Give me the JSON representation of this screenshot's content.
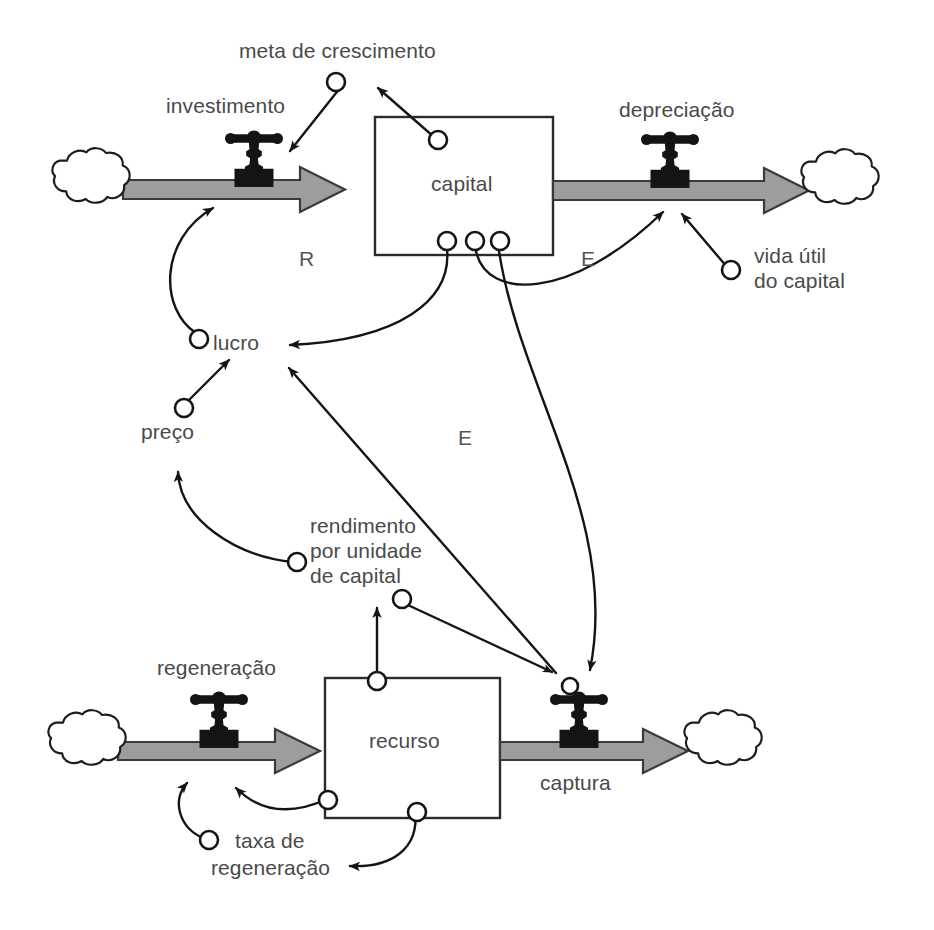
{
  "diagram": {
    "language": "pt-BR",
    "stocks": [
      {
        "id": "capital",
        "label": "capital"
      },
      {
        "id": "recurso",
        "label": "recurso"
      }
    ],
    "flows": [
      {
        "id": "investimento",
        "label": "investimento",
        "direction": "inflow",
        "target": "capital"
      },
      {
        "id": "depreciacao",
        "label": "depreciação",
        "direction": "outflow",
        "source": "capital"
      },
      {
        "id": "regeneracao",
        "label": "regeneração",
        "direction": "inflow",
        "target": "recurso"
      },
      {
        "id": "captura",
        "label": "captura",
        "direction": "outflow",
        "source": "recurso"
      }
    ],
    "variables": [
      {
        "id": "meta_de_crescimento",
        "label": "meta de crescimento"
      },
      {
        "id": "vida_util_do_capital",
        "label": "vida útil\ndo capital",
        "line1": "vida útil",
        "line2": "do capital"
      },
      {
        "id": "lucro",
        "label": "lucro"
      },
      {
        "id": "preco",
        "label": "preço"
      },
      {
        "id": "rendimento_por_unidade_de_capital",
        "label": "rendimento por unidade de capital",
        "line1": "rendimento",
        "line2": "por unidade",
        "line3": "de capital"
      },
      {
        "id": "taxa_de_regeneracao",
        "label": "taxa de regeneração",
        "line1": "taxa de",
        "line2": "regeneração"
      }
    ],
    "loops": [
      {
        "id": "loop-r",
        "label": "R",
        "type": "reinforcing"
      },
      {
        "id": "loop-e-right",
        "label": "E",
        "type": "balancing"
      },
      {
        "id": "loop-e-middle",
        "label": "E",
        "type": "balancing"
      }
    ],
    "colors": {
      "ink": "#1a1a1a",
      "text": "#4a4a4a",
      "pipe_fill": "#9d9d9d",
      "pipe_stroke": "#3a3a3a",
      "stock_stroke": "#2b2b2b",
      "background": "#ffffff"
    }
  }
}
